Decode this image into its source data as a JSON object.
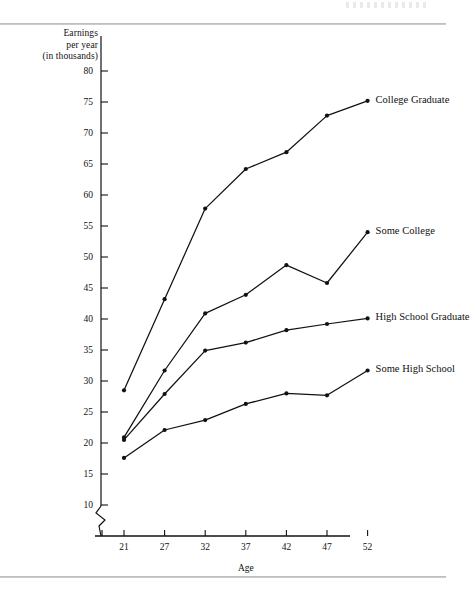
{
  "figure": {
    "y_axis_title_lines": [
      "Earnings",
      "per year",
      "(in thousands)"
    ],
    "x_axis_title": "Age"
  },
  "chart_data": {
    "type": "line",
    "title": "",
    "xlabel": "Age",
    "ylabel": "Earnings per year (in thousands)",
    "x": [
      21,
      27,
      32,
      37,
      42,
      47,
      52
    ],
    "categories": [
      "21",
      "27",
      "32",
      "37",
      "42",
      "47",
      "52"
    ],
    "xtick_labels": [
      "21",
      "27",
      "32",
      "37",
      "42",
      "47",
      "52"
    ],
    "ytick_labels": [
      "80",
      "75",
      "70",
      "65",
      "60",
      "55",
      "50",
      "45",
      "40",
      "35",
      "30",
      "25",
      "20",
      "15",
      "10"
    ],
    "yticks": [
      80,
      75,
      70,
      65,
      60,
      55,
      50,
      45,
      40,
      35,
      30,
      25,
      20,
      15,
      10
    ],
    "ylim": [
      10,
      80
    ],
    "xlim": [
      21,
      52
    ],
    "grid": false,
    "axis_break_y": true,
    "legend_position": "right-inline-end-of-line",
    "marker": "filled-circle",
    "line_color": "#111111",
    "series": [
      {
        "name": "College Graduate",
        "values": [
          28.5,
          43.2,
          57.8,
          64.2,
          66.9,
          72.8,
          75.2
        ]
      },
      {
        "name": "Some College",
        "values": [
          20.9,
          31.7,
          40.9,
          43.9,
          48.7,
          45.8,
          54.0
        ]
      },
      {
        "name": "High School Graduate",
        "values": [
          20.5,
          27.9,
          34.9,
          36.2,
          38.2,
          39.2,
          40.1
        ]
      },
      {
        "name": "Some High School",
        "values": [
          17.6,
          22.1,
          23.7,
          26.3,
          28.0,
          27.7,
          31.7
        ]
      }
    ]
  }
}
